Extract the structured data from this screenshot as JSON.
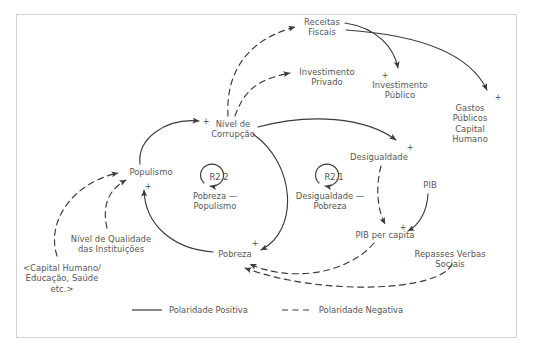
{
  "diagram": {
    "type": "causal-loop-diagram",
    "frame_color": "#d2d2d2",
    "text_color": "#565656",
    "line_color": "#3a3a3a",
    "background": "#ffffff"
  },
  "nodes": [
    {
      "id": "receitas_fiscais",
      "label": "Receitas\nFiscais",
      "x": 322,
      "y": 22
    },
    {
      "id": "investimento_privado",
      "label": "Investimento\nPrivado",
      "x": 327,
      "y": 72
    },
    {
      "id": "investimento_publico",
      "label": "Investimento\nPúblico",
      "x": 400,
      "y": 85
    },
    {
      "id": "gastos_publicos",
      "label": "Gastos Públicos\nCapital Humano",
      "x": 470,
      "y": 108
    },
    {
      "id": "nivel_corrupcao",
      "label": "Nível de\nCorrupção",
      "x": 233,
      "y": 124
    },
    {
      "id": "desigualdade",
      "label": "Desigualdade",
      "x": 379,
      "y": 157
    },
    {
      "id": "pib",
      "label": "PIB",
      "x": 430,
      "y": 185
    },
    {
      "id": "populismo",
      "label": "Populismo",
      "x": 151,
      "y": 172
    },
    {
      "id": "pobreza",
      "label": "Pobreza",
      "x": 235,
      "y": 254
    },
    {
      "id": "pib_per_capita",
      "label": "PIB per capita",
      "x": 385,
      "y": 235
    },
    {
      "id": "repasses_verbas",
      "label": "Repasses Verbas\nSociais",
      "x": 450,
      "y": 254
    },
    {
      "id": "nivel_qualidade",
      "label": "Nível de Qualidade\ndas Instituições",
      "x": 111,
      "y": 239
    },
    {
      "id": "capital_humano",
      "label": "<Capital Humano/\nEducação, Saúde\netc.>",
      "x": 62,
      "y": 268
    }
  ],
  "loops": [
    {
      "id": "R2.2",
      "name": "R2.2",
      "label": "Pobreza —\nPopulismo",
      "cx": 215,
      "cy": 180,
      "label_x": 215,
      "label_y": 192
    },
    {
      "id": "R2.1",
      "name": "R2.1",
      "label": "Desigualdade —\nPobreza",
      "cx": 330,
      "cy": 180,
      "label_x": 330,
      "label_y": 192
    }
  ],
  "polarities": [
    {
      "id": "p_nivel_corrupcao",
      "sign": "+",
      "x": 206,
      "y": 122
    },
    {
      "id": "p_desigualdade",
      "sign": "+",
      "x": 410,
      "y": 148
    },
    {
      "id": "p_investimento_pub",
      "sign": "+",
      "x": 385,
      "y": 76
    },
    {
      "id": "p_gastos_publicos",
      "sign": "+",
      "x": 498,
      "y": 98
    },
    {
      "id": "p_populismo",
      "sign": "+",
      "x": 148,
      "y": 187
    },
    {
      "id": "p_pobreza",
      "sign": "+",
      "x": 255,
      "y": 244
    },
    {
      "id": "p_pib_per_capita",
      "sign": "+",
      "x": 403,
      "y": 228
    }
  ],
  "edges": [
    {
      "id": "corrupcao_receitas",
      "from": "nivel_corrupcao",
      "to": "receitas_fiscais",
      "polarity": "negative"
    },
    {
      "id": "corrupcao_invprivado",
      "from": "nivel_corrupcao",
      "to": "investimento_privado",
      "polarity": "negative"
    },
    {
      "id": "receitas_invpublico",
      "from": "receitas_fiscais",
      "to": "investimento_publico",
      "polarity": "positive"
    },
    {
      "id": "receitas_gastos",
      "from": "receitas_fiscais",
      "to": "gastos_publicos",
      "polarity": "positive"
    },
    {
      "id": "corrupcao_desigualdade",
      "from": "nivel_corrupcao",
      "to": "desigualdade",
      "polarity": "positive"
    },
    {
      "id": "populismo_corrupcao",
      "from": "populismo",
      "to": "nivel_corrupcao",
      "polarity": "positive"
    },
    {
      "id": "pobreza_populismo",
      "from": "pobreza",
      "to": "populismo",
      "polarity": "positive"
    },
    {
      "id": "corrupcao_pobreza",
      "from": "nivel_corrupcao",
      "to": "pobreza",
      "polarity": "positive"
    },
    {
      "id": "desigualdade_pibpercapita",
      "from": "desigualdade",
      "to": "pib_per_capita",
      "polarity": "negative"
    },
    {
      "id": "pib_pibpercapita",
      "from": "pib",
      "to": "pib_per_capita",
      "polarity": "positive"
    },
    {
      "id": "pibpercapita_pobreza",
      "from": "pib_per_capita",
      "to": "pobreza",
      "polarity": "negative"
    },
    {
      "id": "repasses_pobreza",
      "from": "repasses_verbas",
      "to": "pobreza",
      "polarity": "negative"
    },
    {
      "id": "capitalhumano_populismo",
      "from": "capital_humano",
      "to": "populismo",
      "polarity": "negative"
    },
    {
      "id": "qualidade_populismo",
      "from": "nivel_qualidade",
      "to": "populismo",
      "polarity": "negative"
    }
  ],
  "legend": {
    "positive": {
      "label": "Polaridade Positiva",
      "style": "solid"
    },
    "negative": {
      "label": "Polaridade Negativa",
      "style": "dashed"
    }
  }
}
